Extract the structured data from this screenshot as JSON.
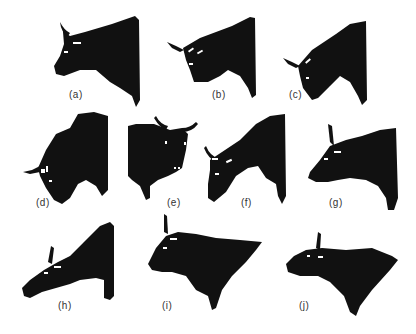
{
  "figure": {
    "colors": {
      "silhouette": "#111111",
      "background": "#ffffff",
      "label": "#333333"
    },
    "panels": [
      {
        "id": "a",
        "label": "(a)"
      },
      {
        "id": "b",
        "label": "(b)"
      },
      {
        "id": "c",
        "label": "(c)"
      },
      {
        "id": "d",
        "label": "(d)"
      },
      {
        "id": "e",
        "label": "(e)"
      },
      {
        "id": "f",
        "label": "(f)"
      },
      {
        "id": "g",
        "label": "(g)"
      },
      {
        "id": "h",
        "label": "(h)"
      },
      {
        "id": "i",
        "label": "(i)"
      },
      {
        "id": "j",
        "label": "(j)"
      }
    ]
  }
}
